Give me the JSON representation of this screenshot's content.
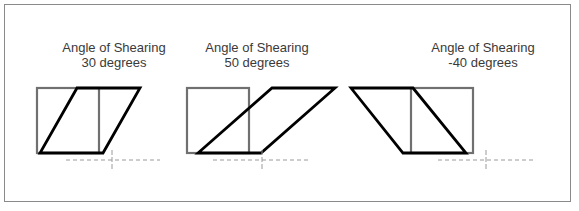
{
  "figures": [
    {
      "title": "Angle of Shearing",
      "value": "30 degrees",
      "angle": 30,
      "label_center_x": 114,
      "rect": {
        "x": 37,
        "y": 88,
        "w": 62,
        "h": 65
      },
      "shear_poly": "77,88 140,88 103,153 40,153",
      "guide": {
        "x1": 66,
        "x2": 160,
        "y": 160,
        "cross_x": 112
      }
    },
    {
      "title": "Angle of Shearing",
      "value": "50 degrees",
      "angle": 50,
      "label_center_x": 257,
      "rect": {
        "x": 187,
        "y": 88,
        "w": 62,
        "h": 65
      },
      "shear_poly": "272,88 335,88 261,153 198,153",
      "guide": {
        "x1": 213,
        "x2": 308,
        "y": 160,
        "cross_x": 262
      }
    },
    {
      "title": "Angle of Shearing",
      "value": "-40 degrees",
      "angle": -40,
      "label_center_x": 483,
      "rect": {
        "x": 411,
        "y": 88,
        "w": 62,
        "h": 65
      },
      "shear_poly": "351,88 413,88 466,153 403,153",
      "guide": {
        "x1": 438,
        "x2": 533,
        "y": 160,
        "cross_x": 486
      }
    }
  ],
  "colors": {
    "original_rect": "#707070",
    "sheared_shape": "#000000",
    "guide": "#9a9a9a",
    "frame": "#8a8a8a",
    "text": "#3a3a3a"
  }
}
